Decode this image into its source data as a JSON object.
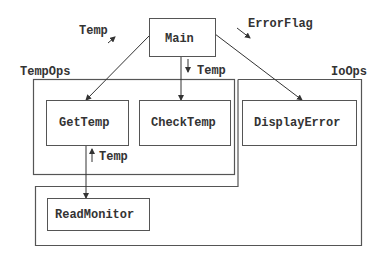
{
  "diagram": {
    "modules": {
      "main": "Main",
      "get_temp": "GetTemp",
      "check_temp": "CheckTemp",
      "display_error": "DisplayError",
      "read_monitor": "ReadMonitor"
    },
    "groups": {
      "temp_ops": "TempOps",
      "io_ops": "IoOps"
    },
    "data_flows": {
      "main_getTemp": "Temp",
      "main_checkTemp": "Temp",
      "main_displayError": "ErrorFlag",
      "readMonitor_getTemp": "Temp"
    },
    "edges": [
      {
        "from": "Main",
        "to": "GetTemp"
      },
      {
        "from": "Main",
        "to": "CheckTemp"
      },
      {
        "from": "Main",
        "to": "DisplayError"
      },
      {
        "from": "GetTemp",
        "to": "ReadMonitor"
      }
    ]
  }
}
